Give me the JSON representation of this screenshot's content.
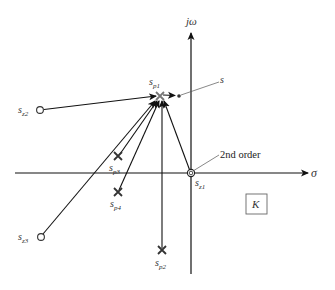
{
  "diagram": {
    "type": "s-plane pole-zero vector diagram",
    "axes": {
      "imag_label": "jω",
      "real_label": "σ"
    },
    "test_point": {
      "label": "s"
    },
    "poles": [
      {
        "id": "sp1",
        "base": "s",
        "sub": "p1"
      },
      {
        "id": "sp2",
        "base": "s",
        "sub": "p2"
      },
      {
        "id": "sp3",
        "base": "s",
        "sub": "p3"
      },
      {
        "id": "sp4",
        "base": "s",
        "sub": "p4"
      }
    ],
    "zeros": [
      {
        "id": "sz1",
        "base": "s",
        "sub": "z1",
        "note": "2nd order"
      },
      {
        "id": "sz2",
        "base": "s",
        "sub": "z2"
      },
      {
        "id": "sz3",
        "base": "s",
        "sub": "z3"
      }
    ],
    "annotation": "2nd order",
    "gain_box": "K"
  }
}
